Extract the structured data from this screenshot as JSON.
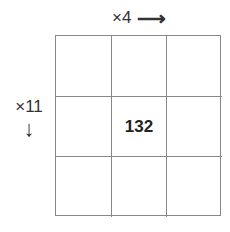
{
  "diagram": {
    "top_multiplier": "×4",
    "top_arrow": "⟶",
    "side_multiplier": "×11",
    "side_arrow": "↓",
    "grid": {
      "rows": 3,
      "cols": 3,
      "cells": [
        "",
        "",
        "",
        "",
        "132",
        "",
        "",
        "",
        ""
      ]
    }
  }
}
